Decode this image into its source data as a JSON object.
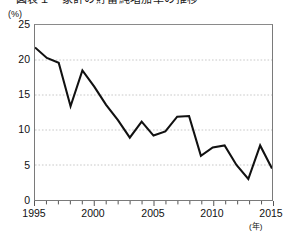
{
  "title_cut": "図表１　家計の貯蓄純増加率の推移",
  "axes": {
    "y_unit": "(%)",
    "x_unit": "(年)",
    "y_ticks": [
      "0",
      "5",
      "10",
      "15",
      "20",
      "25"
    ],
    "x_ticks": [
      "1995",
      "2000",
      "2005",
      "2010",
      "2015"
    ]
  },
  "chart_data": {
    "type": "line",
    "title": "",
    "xlabel": "(年)",
    "ylabel": "(%)",
    "xlim": [
      1995,
      2015
    ],
    "ylim": [
      0,
      25
    ],
    "grid": true,
    "legend": "none",
    "line_color": "#111111",
    "x": [
      1995,
      1996,
      1997,
      1998,
      1999,
      2000,
      2001,
      2002,
      2003,
      2004,
      2005,
      2006,
      2007,
      2008,
      2009,
      2010,
      2011,
      2012,
      2013,
      2014,
      2015
    ],
    "values": [
      21.8,
      20.3,
      19.6,
      13.4,
      18.5,
      16.2,
      13.6,
      11.4,
      8.9,
      11.2,
      9.2,
      9.8,
      11.9,
      12.0,
      6.3,
      7.5,
      7.8,
      5.0,
      3.0,
      7.8,
      4.5
    ],
    "series": [
      {
        "name": "rate",
        "values": [
          21.8,
          20.3,
          19.6,
          13.4,
          18.5,
          16.2,
          13.6,
          11.4,
          8.9,
          11.2,
          9.2,
          9.8,
          11.9,
          12.0,
          6.3,
          7.5,
          7.8,
          5.0,
          3.0,
          7.8,
          4.5
        ]
      }
    ],
    "categories": [
      "1995",
      "1996",
      "1997",
      "1998",
      "1999",
      "2000",
      "2001",
      "2002",
      "2003",
      "2004",
      "2005",
      "2006",
      "2007",
      "2008",
      "2009",
      "2010",
      "2011",
      "2012",
      "2013",
      "2014",
      "2015"
    ]
  }
}
